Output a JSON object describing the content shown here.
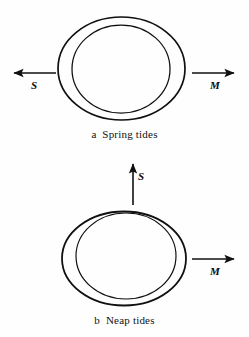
{
  "figure": {
    "background_color": "#fefefe",
    "stroke_color": "#101010",
    "panels": [
      {
        "id": "spring",
        "caption": "a  Spring tides",
        "earth": {
          "outer_ellipse": {
            "cx": 121.5,
            "cy": 68.5,
            "rx": 63.5,
            "ry": 51.5
          },
          "inner_circle": {
            "cx": 121.0,
            "cy": 69.0,
            "rx": 49.0,
            "ry": 44.0
          }
        },
        "vectors": [
          {
            "name": "sun-vector",
            "label": "S",
            "meaning": "sun-pull-left",
            "direction": "left",
            "x1": 56,
            "y1": 73,
            "x2": 12,
            "y2": 73
          },
          {
            "name": "moon-vector",
            "label": "M",
            "meaning": "moon-pull-right",
            "direction": "right",
            "x1": 192,
            "y1": 73,
            "x2": 236,
            "y2": 73
          }
        ]
      },
      {
        "id": "neap",
        "caption": "b  Neap tides",
        "earth": {
          "outer_ellipse": {
            "cx": 124.0,
            "cy": 258.5,
            "rx": 62.0,
            "ry": 47.0
          },
          "inner_circle": {
            "cx": 126.0,
            "cy": 256.0,
            "rx": 50.0,
            "ry": 43.0
          }
        },
        "vectors": [
          {
            "name": "sun-vector",
            "label": "S",
            "meaning": "sun-pull-up",
            "direction": "up",
            "x1": 133,
            "y1": 205,
            "x2": 133,
            "y2": 162
          },
          {
            "name": "moon-vector",
            "label": "M",
            "meaning": "moon-pull-right",
            "direction": "right",
            "x1": 192,
            "y1": 259,
            "x2": 236,
            "y2": 259
          }
        ]
      }
    ]
  },
  "labels": {
    "spring_sun": "S",
    "spring_moon": "M",
    "neap_sun": "S",
    "neap_moon": "M"
  },
  "captions": {
    "spring": "a  Spring tides",
    "neap": "b  Neap tides"
  }
}
